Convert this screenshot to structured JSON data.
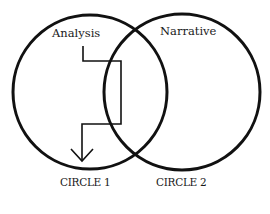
{
  "diagram": {
    "type": "venn",
    "colors": {
      "stroke": "#111111",
      "text": "#1a1a1a",
      "background": "#ffffff"
    },
    "circles": [
      {
        "id": "circle-1",
        "label": "Analysis",
        "caption": "CIRCLE 1"
      },
      {
        "id": "circle-2",
        "label": "Narrative",
        "caption": "CIRCLE 2"
      }
    ],
    "arrow": {
      "from": "Analysis",
      "description": "path from Analysis crossing into overlap region and back down into Circle 1",
      "icon": "down-arrow-icon"
    }
  }
}
